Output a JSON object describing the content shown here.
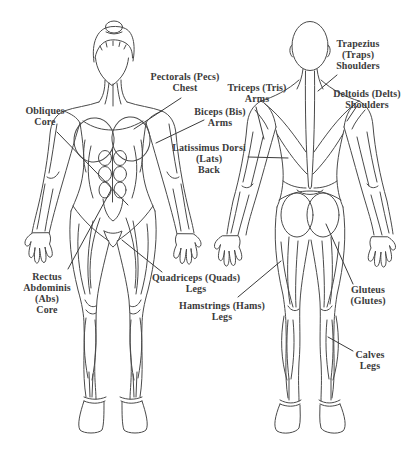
{
  "diagram_title": "",
  "colors": {
    "outline": "#4a4a4a",
    "leader_line": "#3b3b3b",
    "label_text": "#3b3b3b",
    "background": "#ffffff"
  },
  "labels": {
    "obliques": {
      "muscle": "Obliques",
      "lines": [
        "Obliques",
        "Core"
      ]
    },
    "pectorals": {
      "muscle": "Pectorals",
      "lines": [
        "Pectorals (Pecs)",
        "Chest"
      ]
    },
    "biceps": {
      "muscle": "Biceps",
      "lines": [
        "Biceps (Bis)",
        "Arms"
      ]
    },
    "triceps": {
      "muscle": "Triceps",
      "lines": [
        "Triceps (Tris)",
        "Arms"
      ]
    },
    "latissimus": {
      "muscle": "Latissimus Dorsi",
      "lines": [
        "Latissimus Dorsi",
        "(Lats)",
        "Back"
      ]
    },
    "trapezius": {
      "muscle": "Trapezius",
      "lines": [
        "Trapezius",
        "(Traps)",
        "Shoulders"
      ]
    },
    "deltoids": {
      "muscle": "Deltoids",
      "lines": [
        "Deltoids (Delts)",
        "Shoulders"
      ]
    },
    "rectus_abdominis": {
      "muscle": "Rectus Abdominis",
      "lines": [
        "Rectus",
        "Abdominis",
        "(Abs)",
        "Core"
      ]
    },
    "quadriceps": {
      "muscle": "Quadriceps",
      "lines": [
        "Quadriceps (Quads)",
        "Legs"
      ]
    },
    "hamstrings": {
      "muscle": "Hamstrings",
      "lines": [
        "Hamstrings (Hams)",
        "Legs"
      ]
    },
    "gluteus": {
      "muscle": "Gluteus",
      "lines": [
        "Gluteus",
        "(Glutes)"
      ]
    },
    "calves": {
      "muscle": "Calves",
      "lines": [
        "Calves",
        "Legs"
      ]
    }
  }
}
